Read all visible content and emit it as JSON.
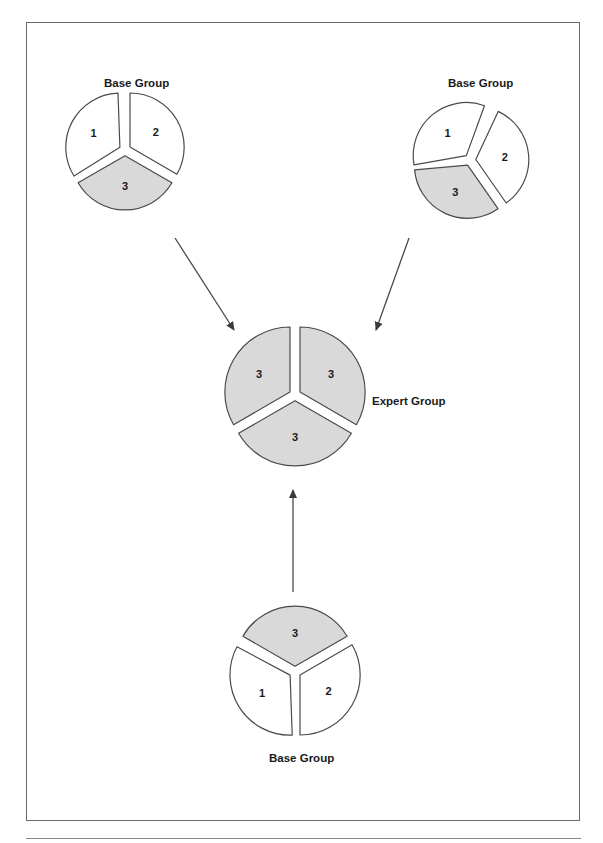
{
  "diagram": {
    "colors": {
      "shaded": "#d9d9d9",
      "unshaded": "#ffffff",
      "stroke": "#4a4a4a",
      "frame": "#6a6a6a"
    },
    "groups": [
      {
        "id": "base-top-left",
        "label": "Base Group",
        "pieces": [
          {
            "number": "1",
            "shaded": false
          },
          {
            "number": "2",
            "shaded": false
          },
          {
            "number": "3",
            "shaded": true
          }
        ]
      },
      {
        "id": "base-top-right",
        "label": "Base Group",
        "pieces": [
          {
            "number": "1",
            "shaded": false
          },
          {
            "number": "2",
            "shaded": false
          },
          {
            "number": "3",
            "shaded": true
          }
        ]
      },
      {
        "id": "expert",
        "label": "Expert Group",
        "pieces": [
          {
            "number": "3",
            "shaded": true
          },
          {
            "number": "3",
            "shaded": true
          },
          {
            "number": "3",
            "shaded": true
          }
        ]
      },
      {
        "id": "base-bottom",
        "label": "Base Group",
        "pieces": [
          {
            "number": "1",
            "shaded": false
          },
          {
            "number": "2",
            "shaded": false
          },
          {
            "number": "3",
            "shaded": true
          }
        ]
      }
    ],
    "arrows": [
      {
        "from": "base-top-left",
        "to": "expert"
      },
      {
        "from": "base-top-right",
        "to": "expert"
      },
      {
        "from": "base-bottom",
        "to": "expert"
      }
    ]
  }
}
